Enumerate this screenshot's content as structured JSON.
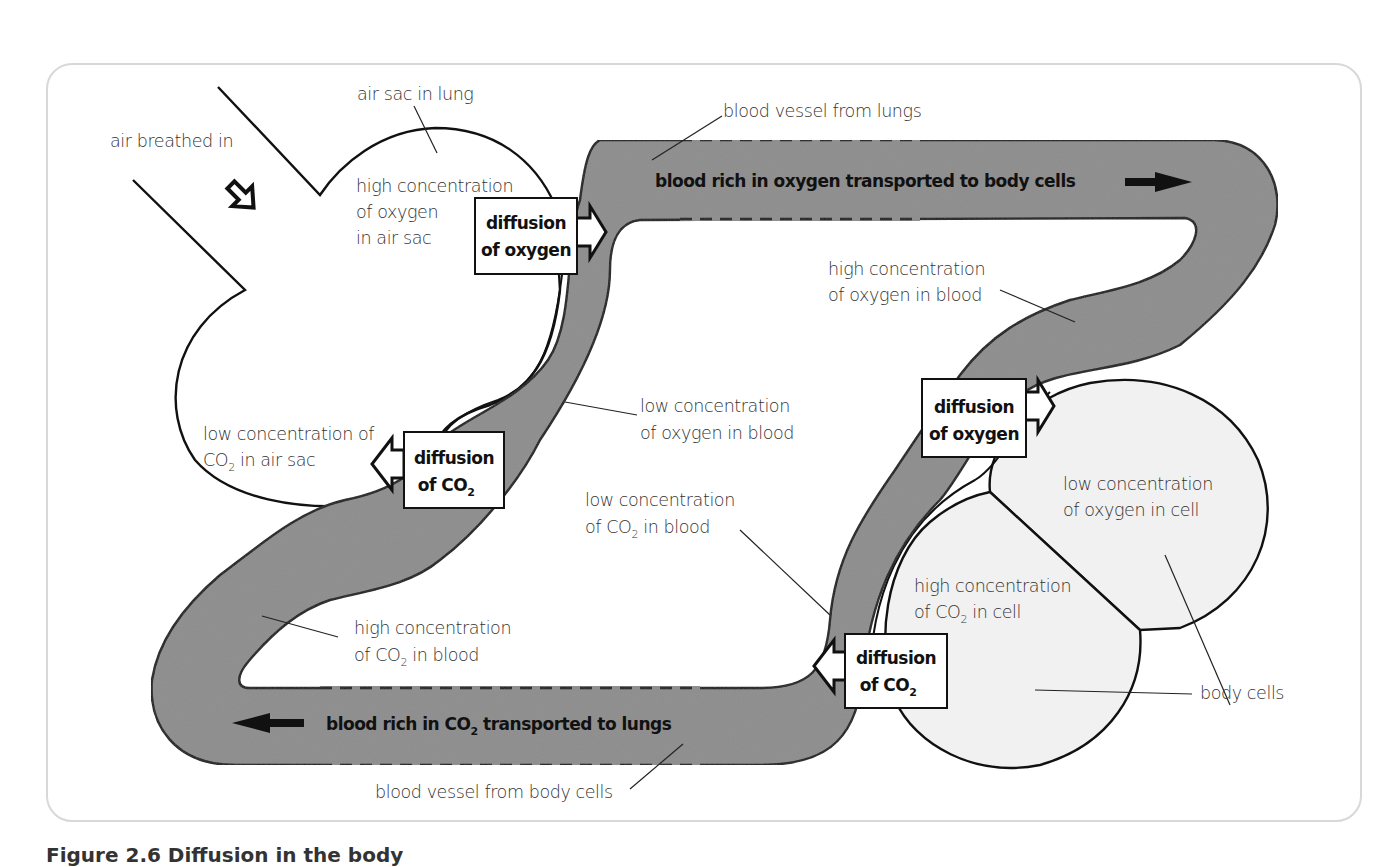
{
  "figure": {
    "caption": "Figure 2.6 Diffusion in the body"
  },
  "colors": {
    "vessel_fill": "#8c8c8c",
    "cell_fill": "#f1f1f1",
    "outline": "#111111",
    "frame_border": "#d8d8d8",
    "label_text": "#333333"
  },
  "labels": {
    "air_breathed_in": "air breathed in",
    "air_sac_in_lung": "air sac in lung",
    "high_o2_air_sac": [
      "high concentration",
      "of oxygen",
      "in air sac"
    ],
    "low_co2_air_sac_l1": "low concentration of",
    "low_co2_air_sac_l2a": "CO",
    "low_co2_air_sac_l2sub": "2",
    "low_co2_air_sac_l2b": " in air sac",
    "blood_vessel_from_lungs": "blood vessel from lungs",
    "blood_rich_o2": "blood rich in oxygen transported to body cells",
    "high_o2_blood": [
      "high concentration",
      "of oxygen in blood"
    ],
    "low_o2_blood": [
      "low concentration",
      "of oxygen in blood"
    ],
    "low_co2_blood_l1": "low concentration",
    "low_co2_blood_l2a": "of CO",
    "low_co2_blood_l2sub": "2",
    "low_co2_blood_l2b": " in blood",
    "low_o2_cell": [
      "low concentration",
      "of oxygen in cell"
    ],
    "high_co2_cell_l1": "high concentration",
    "high_co2_cell_l2a": "of CO",
    "high_co2_cell_l2sub": "2",
    "high_co2_cell_l2b": " in cell",
    "body_cells": "body cells",
    "high_co2_blood_l1": "high concentration",
    "high_co2_blood_l2a": "of CO",
    "high_co2_blood_l2sub": "2",
    "high_co2_blood_l2b": " in blood",
    "blood_rich_co2_a": "blood rich in CO",
    "blood_rich_co2_sub": "2",
    "blood_rich_co2_b": " transported to lungs",
    "blood_vessel_from_body": "blood vessel from body cells"
  },
  "boxes": {
    "diffusion_o2_lung": [
      "diffusion",
      "of oxygen"
    ],
    "diffusion_co2_lung": {
      "l1": "diffusion",
      "l2a": "of CO",
      "l2sub": "2"
    },
    "diffusion_o2_cell": [
      "diffusion",
      "of oxygen"
    ],
    "diffusion_co2_cell": {
      "l1": "diffusion",
      "l2a": "of CO",
      "l2sub": "2"
    }
  }
}
